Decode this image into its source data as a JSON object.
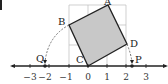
{
  "diagram": {
    "points": {
      "A": {
        "label": "A",
        "x": 1,
        "y": 3
      },
      "B": {
        "label": "B",
        "x": -1,
        "y": 2
      },
      "C": {
        "label": "C",
        "x": 0,
        "y": 0
      },
      "D": {
        "label": "D",
        "x": 2,
        "y": 1
      },
      "P": {
        "label": "P"
      },
      "Q": {
        "label": "Q"
      }
    },
    "axis_ticks": [
      "−3",
      "−2",
      "−1",
      "0",
      "1",
      "2",
      "3"
    ],
    "colors": {
      "square_fill": "#c8c8c8",
      "grid": "#bbbbbb",
      "line": "#222222"
    }
  }
}
